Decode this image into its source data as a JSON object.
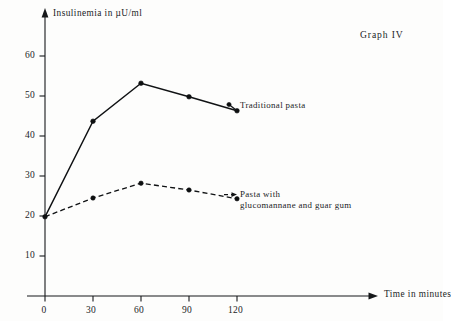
{
  "figure": {
    "graph_number": "Graph IV",
    "background_color": "#fdfdfc",
    "ink_color": "#101214"
  },
  "axes": {
    "y_title": "Insulinemia in µU/ml",
    "x_title": "Time in minutes",
    "y_ticks": [
      "10",
      "20",
      "30",
      "40",
      "50",
      "60"
    ],
    "x_ticks": [
      "0",
      "30",
      "60",
      "90",
      "120"
    ]
  },
  "legend": {
    "traditional": "Traditional pasta",
    "glucomannane_line1": "Pasta with",
    "glucomannane_line2": "glucomannane and guar gum"
  },
  "chart_data": {
    "type": "line",
    "title": "Graph IV",
    "xlabel": "Time in minutes",
    "ylabel": "Insulinemia in µU/ml",
    "x": [
      0,
      30,
      60,
      90,
      120
    ],
    "xlim": [
      0,
      135
    ],
    "ylim": [
      0,
      65
    ],
    "x_tick_values": [
      0,
      30,
      60,
      90,
      120
    ],
    "y_tick_values": [
      10,
      20,
      30,
      40,
      50,
      60
    ],
    "grid": false,
    "legend_position": "inline-right-annotations",
    "series": [
      {
        "name": "Traditional pasta",
        "style": "solid",
        "marker": "filled-circle",
        "values": [
          19.8,
          43.7,
          53.2,
          49.8,
          46.3
        ]
      },
      {
        "name": "Pasta with glucomannane and guar gum",
        "style": "dashed",
        "marker": "filled-circle",
        "values": [
          19.8,
          24.5,
          28.2,
          26.5,
          24.3
        ]
      }
    ]
  }
}
